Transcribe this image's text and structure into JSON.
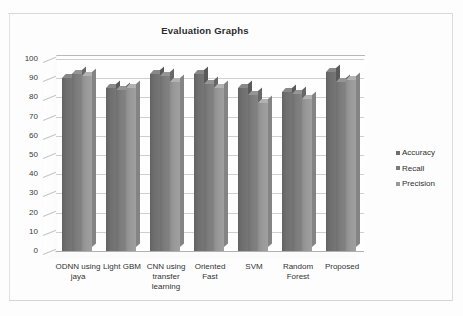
{
  "chart_data": {
    "type": "bar",
    "title": "Evaluation Graphs",
    "xlabel": "",
    "ylabel": "",
    "ylim": [
      0,
      100
    ],
    "ytick_step": 10,
    "yticks": [
      "100",
      "90",
      "80",
      "70",
      "60",
      "50",
      "40",
      "30",
      "20",
      "10",
      "0"
    ],
    "grid": true,
    "legend_position": "right",
    "style": "3d-clustered-column",
    "categories": [
      "ODNN using jaya",
      "Light GBM",
      "CNN using transfer learning",
      "Oriented Fast",
      "SVM",
      "Random Forest",
      "Proposed"
    ],
    "series": [
      {
        "name": "Accuracy",
        "color": "#6e6e6e",
        "values": [
          90,
          85,
          92,
          92,
          85,
          83,
          93
        ]
      },
      {
        "name": "Recall",
        "color": "#7b7b7b",
        "values": [
          92,
          84,
          91,
          87,
          81,
          82,
          88
        ]
      },
      {
        "name": "Precision",
        "color": "#989898",
        "values": [
          91,
          85,
          88,
          85,
          77,
          79,
          89
        ]
      }
    ]
  },
  "legend": {
    "items": [
      {
        "label": "Accuracy",
        "marker": "square-marker"
      },
      {
        "label": "Recall",
        "marker": "square-marker"
      },
      {
        "label": "Precision",
        "marker": "square-marker"
      }
    ]
  },
  "axis": {
    "y_ticks": [
      "100",
      "90",
      "80",
      "70",
      "60",
      "50",
      "40",
      "30",
      "20",
      "10",
      "0"
    ],
    "x_categories": [
      [
        "ODNN using",
        "jaya"
      ],
      [
        "Light GBM"
      ],
      [
        "CNN using",
        "transfer",
        "learning"
      ],
      [
        "Oriented",
        "Fast"
      ],
      [
        "SVM"
      ],
      [
        "Random",
        "Forest"
      ],
      [
        "Proposed"
      ]
    ]
  },
  "colors": {
    "accuracy": "#6e6e6e",
    "recall": "#7b7b7b",
    "precision": "#989898",
    "gridline": "#cfcfcf",
    "title": "#2b2b2b",
    "background": "#fdfdfd"
  }
}
